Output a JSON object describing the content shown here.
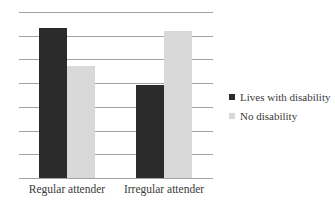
{
  "chart_data": {
    "type": "bar",
    "title": "",
    "xlabel": "",
    "ylabel": "",
    "categories": [
      "Regular attender",
      "Irregular attender"
    ],
    "series": [
      {
        "name": "Lives with disability",
        "color": "#2b2b2b",
        "values": [
          6.33,
          3.92
        ]
      },
      {
        "name": "No disability",
        "color": "#d9d9d9",
        "values": [
          4.73,
          6.2
        ]
      }
    ],
    "ylim": [
      0,
      7
    ],
    "y_ticks_labeled": false,
    "gridlines": {
      "on": true,
      "count": 8,
      "color": "#a3a3a3"
    },
    "legend": {
      "position": "right"
    }
  }
}
